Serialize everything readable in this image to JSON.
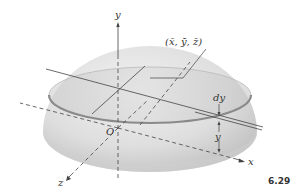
{
  "figure": {
    "number": "6.29",
    "labels": {
      "y_axis": "y",
      "x_axis": "x",
      "z_axis": "z",
      "origin": "O",
      "centroid": "(x̄, ȳ, z̄)",
      "slice_thickness": "dy",
      "slice_height": "y"
    },
    "colors": {
      "hemisphere_fill": "#e6e6e6",
      "hemisphere_shade": "#c8c8c8",
      "cap_fill": "#d2d2d2",
      "line": "#444444"
    }
  }
}
